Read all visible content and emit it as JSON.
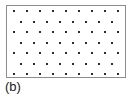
{
  "figure": {
    "label": "(b)",
    "caption_label": "(b)",
    "box": {
      "border_color": "#8c8c8c",
      "background_color": "#ffffff",
      "x": 6,
      "y": 5,
      "width": 120,
      "height": 73
    },
    "dot_color": "#2b2b2b",
    "dot_size_px": 2
  },
  "chart_data": {
    "type": "scatter",
    "title": "",
    "subtitle": "",
    "xlabel": "",
    "ylabel": "",
    "annotations": [
      "(b)"
    ],
    "legend": [],
    "grid": false,
    "xlim": [
      0,
      120
    ],
    "ylim": [
      0,
      73
    ],
    "rows": 7,
    "row_offsets": [
      "aligned",
      "offset",
      "aligned",
      "offset",
      "aligned",
      "offset",
      "aligned"
    ],
    "dots_per_row": [
      9,
      8,
      9,
      8,
      9,
      8,
      9
    ],
    "row_spacing": 10.5,
    "column_spacing": 13,
    "x_start": 7,
    "y_start": 5,
    "points": [
      {
        "x": 7,
        "y": 5
      },
      {
        "x": 20,
        "y": 5
      },
      {
        "x": 33,
        "y": 5
      },
      {
        "x": 46,
        "y": 5
      },
      {
        "x": 59,
        "y": 5
      },
      {
        "x": 72,
        "y": 5
      },
      {
        "x": 85,
        "y": 5
      },
      {
        "x": 98,
        "y": 5
      },
      {
        "x": 111,
        "y": 5
      },
      {
        "x": 13.5,
        "y": 15.5
      },
      {
        "x": 26.5,
        "y": 15.5
      },
      {
        "x": 39.5,
        "y": 15.5
      },
      {
        "x": 52.5,
        "y": 15.5
      },
      {
        "x": 65.5,
        "y": 15.5
      },
      {
        "x": 78.5,
        "y": 15.5
      },
      {
        "x": 91.5,
        "y": 15.5
      },
      {
        "x": 104.5,
        "y": 15.5
      },
      {
        "x": 7,
        "y": 26
      },
      {
        "x": 20,
        "y": 26
      },
      {
        "x": 33,
        "y": 26
      },
      {
        "x": 46,
        "y": 26
      },
      {
        "x": 59,
        "y": 26
      },
      {
        "x": 72,
        "y": 26
      },
      {
        "x": 85,
        "y": 26
      },
      {
        "x": 98,
        "y": 26
      },
      {
        "x": 111,
        "y": 26
      },
      {
        "x": 13.5,
        "y": 36.5
      },
      {
        "x": 26.5,
        "y": 36.5
      },
      {
        "x": 39.5,
        "y": 36.5
      },
      {
        "x": 52.5,
        "y": 36.5
      },
      {
        "x": 65.5,
        "y": 36.5
      },
      {
        "x": 78.5,
        "y": 36.5
      },
      {
        "x": 91.5,
        "y": 36.5
      },
      {
        "x": 104.5,
        "y": 36.5
      },
      {
        "x": 7,
        "y": 47
      },
      {
        "x": 20,
        "y": 47
      },
      {
        "x": 33,
        "y": 47
      },
      {
        "x": 46,
        "y": 47
      },
      {
        "x": 59,
        "y": 47
      },
      {
        "x": 72,
        "y": 47
      },
      {
        "x": 85,
        "y": 47
      },
      {
        "x": 98,
        "y": 47
      },
      {
        "x": 111,
        "y": 47
      },
      {
        "x": 13.5,
        "y": 57.5
      },
      {
        "x": 26.5,
        "y": 57.5
      },
      {
        "x": 39.5,
        "y": 57.5
      },
      {
        "x": 52.5,
        "y": 57.5
      },
      {
        "x": 65.5,
        "y": 57.5
      },
      {
        "x": 78.5,
        "y": 57.5
      },
      {
        "x": 91.5,
        "y": 57.5
      },
      {
        "x": 104.5,
        "y": 57.5
      },
      {
        "x": 7,
        "y": 68
      },
      {
        "x": 20,
        "y": 68
      },
      {
        "x": 33,
        "y": 68
      },
      {
        "x": 46,
        "y": 68
      },
      {
        "x": 59,
        "y": 68
      },
      {
        "x": 72,
        "y": 68
      },
      {
        "x": 85,
        "y": 68
      },
      {
        "x": 98,
        "y": 68
      },
      {
        "x": 111,
        "y": 68
      }
    ]
  }
}
